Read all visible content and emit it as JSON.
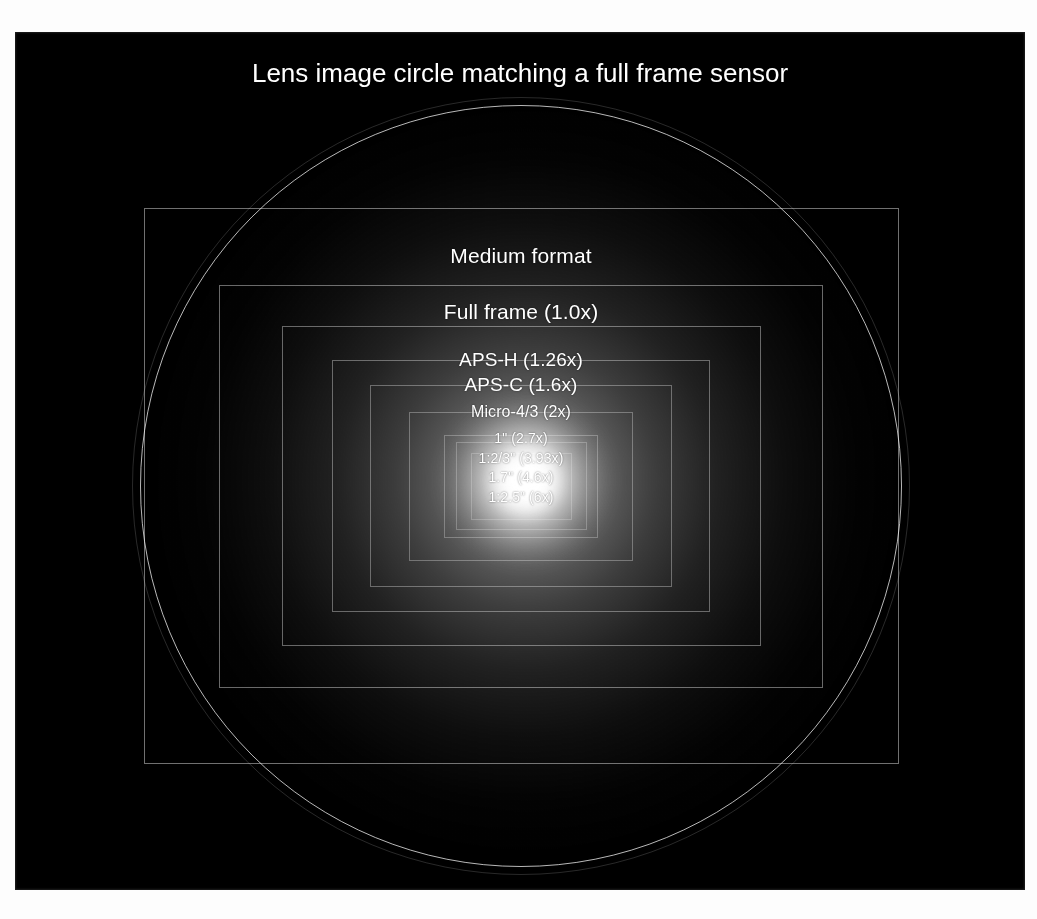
{
  "figure": {
    "title": "Lens image circle matching a full frame sensor",
    "background_color": "#000000",
    "page_color": "#ffffff",
    "outline_color": "#ffffff"
  },
  "chart_data": {
    "type": "diagram",
    "title": "Lens image circle matching a full frame sensor",
    "reference_format": "Full frame (1.0x)",
    "image_circle": {
      "label": "lens image circle",
      "center_x": 506,
      "center_y": 454,
      "radius": 381,
      "matches": "full frame sensor diagonal"
    },
    "formats": [
      {
        "name": "Medium format",
        "label": "Medium format",
        "crop_factor": 0.79,
        "width": 755,
        "height": 556,
        "center_x": 506,
        "center_y": 454,
        "label_y": 212,
        "font_size": 21
      },
      {
        "name": "Full frame",
        "label": "Full frame (1.0x)",
        "crop_factor": 1.0,
        "width": 604,
        "height": 403,
        "center_x": 506,
        "center_y": 454,
        "label_y": 268,
        "font_size": 21
      },
      {
        "name": "APS-H",
        "label": "APS-H (1.26x)",
        "crop_factor": 1.26,
        "width": 479,
        "height": 320,
        "center_x": 506,
        "center_y": 454,
        "label_y": 317,
        "font_size": 19
      },
      {
        "name": "APS-C",
        "label": "APS-C (1.6x)",
        "crop_factor": 1.6,
        "width": 378,
        "height": 252,
        "center_x": 506,
        "center_y": 454,
        "label_y": 342,
        "font_size": 19
      },
      {
        "name": "Micro-4/3",
        "label": "Micro-4/3 (2x)",
        "crop_factor": 2.0,
        "width": 302,
        "height": 202,
        "center_x": 506,
        "center_y": 454,
        "label_y": 371,
        "font_size": 16
      },
      {
        "name": "1 inch",
        "label": "1\" (2.7x)",
        "crop_factor": 2.7,
        "width": 224,
        "height": 149,
        "center_x": 506,
        "center_y": 454,
        "label_y": 398,
        "font_size": 14
      },
      {
        "name": "1:2/3 inch",
        "label": "1:2/3\" (3.93x)",
        "crop_factor": 3.93,
        "width": 154,
        "height": 103,
        "center_x": 506,
        "center_y": 454,
        "label_y": 418,
        "font_size": 14
      },
      {
        "name": "1.7 inch",
        "label": "1.7\" (4.6x)",
        "crop_factor": 4.6,
        "width": 131,
        "height": 88,
        "center_x": 506,
        "center_y": 454,
        "label_y": 437,
        "font_size": 14
      },
      {
        "name": "1:2.5 inch",
        "label": "1:2.5\" (6x)",
        "crop_factor": 6.0,
        "width": 101,
        "height": 67,
        "center_x": 506,
        "center_y": 454,
        "label_y": 457,
        "font_size": 14
      }
    ]
  }
}
